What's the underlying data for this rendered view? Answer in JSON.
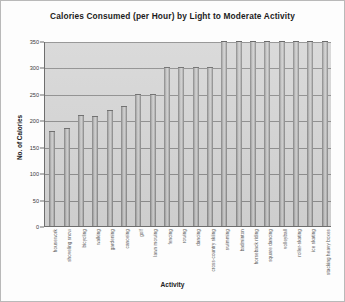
{
  "chart_data": {
    "type": "bar",
    "title": "Calories Consumed (per Hour) by Light to Moderate Activity",
    "xlabel": "Activity",
    "ylabel": "No. of Calories",
    "ylim": [
      0,
      350
    ],
    "yticks": [
      0,
      50,
      100,
      150,
      200,
      250,
      300,
      350
    ],
    "ytick_labels": [
      "0",
      "50",
      "100",
      "150",
      "200",
      "250",
      "300",
      "350"
    ],
    "grid": true,
    "legend": "none",
    "orientation": "vertical",
    "categories": [
      "housework",
      "shoveling snow",
      "bicycling",
      "walking",
      "gardening",
      "canoeing",
      "golf",
      "lawn mowing",
      "fencing",
      "rowing",
      "dancing",
      "cross-country skiing",
      "swimming",
      "badminton",
      "horseback riding",
      "square dancing",
      "volleyball",
      "roller-skating",
      "ice skating",
      "stacking heavy boxes"
    ],
    "values": [
      180,
      185,
      210,
      208,
      220,
      228,
      250,
      250,
      300,
      300,
      300,
      300,
      350,
      350,
      350,
      350,
      350,
      350,
      350,
      350
    ],
    "bar_color": "#c4c4c4",
    "plot_background": "#d6d6d6",
    "figure_background": "#fdfdfd"
  }
}
